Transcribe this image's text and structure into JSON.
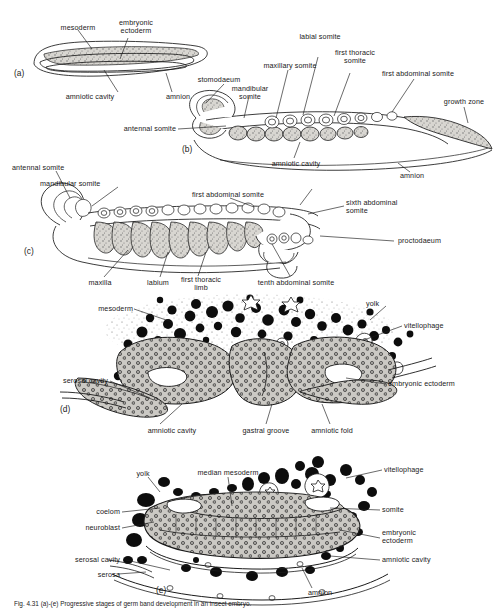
{
  "figure": {
    "panels": [
      {
        "id": "a",
        "id_label": "(a)",
        "labels": [
          {
            "name": "mesoderm",
            "text": "mesoderm"
          },
          {
            "name": "embryonic-ectoderm",
            "text": "embryonic\nectoderm"
          },
          {
            "name": "amniotic-cavity",
            "text": "amniotic cavity"
          },
          {
            "name": "amnion",
            "text": "amnion"
          }
        ]
      },
      {
        "id": "b",
        "id_label": "(b)",
        "labels": [
          {
            "name": "stomodaeum",
            "text": "stomodaeum"
          },
          {
            "name": "mandibular-somite",
            "text": "mandibular\nsomite"
          },
          {
            "name": "maxillary-somite",
            "text": "maxillary somite"
          },
          {
            "name": "labial-somite",
            "text": "labial somite"
          },
          {
            "name": "first-thoracic-somite",
            "text": "first thoracic\nsomite"
          },
          {
            "name": "first-abdominal-somite",
            "text": "first abdominal somite"
          },
          {
            "name": "growth-zone",
            "text": "growth zone"
          },
          {
            "name": "antennal-somite",
            "text": "antennal somite"
          },
          {
            "name": "amniotic-cavity",
            "text": "amniotic cavity"
          },
          {
            "name": "amnion",
            "text": "amnion"
          }
        ]
      },
      {
        "id": "c",
        "id_label": "(c)",
        "labels": [
          {
            "name": "antennal-somite",
            "text": "antennal somite"
          },
          {
            "name": "mandibular-somite",
            "text": "mandibular somite"
          },
          {
            "name": "first-abdominal-somite",
            "text": "first abdominal somite"
          },
          {
            "name": "sixth-abdominal-somite",
            "text": "sixth abdominal\nsomite"
          },
          {
            "name": "proctodaeum",
            "text": "proctodaeum"
          },
          {
            "name": "maxilla",
            "text": "maxilla"
          },
          {
            "name": "labium",
            "text": "labium"
          },
          {
            "name": "first-thoracic-limb",
            "text": "first thoracic\nlimb"
          },
          {
            "name": "tenth-abdominal-somite",
            "text": "tenth abdominal somite"
          }
        ]
      },
      {
        "id": "d",
        "id_label": "(d)",
        "labels": [
          {
            "name": "mesoderm",
            "text": "mesoderm"
          },
          {
            "name": "yolk",
            "text": "yolk"
          },
          {
            "name": "vitellophage",
            "text": "vitellophage"
          },
          {
            "name": "serosal-cavity",
            "text": "serosal cavity"
          },
          {
            "name": "embryonic-ectoderm",
            "text": "embryonic ectoderm"
          },
          {
            "name": "amniotic-cavity",
            "text": "amniotic cavity"
          },
          {
            "name": "gastral-groove",
            "text": "gastral groove"
          },
          {
            "name": "amniotic-fold",
            "text": "amniotic fold"
          }
        ]
      },
      {
        "id": "e",
        "id_label": "(e)",
        "labels": [
          {
            "name": "yolk",
            "text": "yolk"
          },
          {
            "name": "median-mesoderm",
            "text": "median mesoderm"
          },
          {
            "name": "vitellophage",
            "text": "vitellophage"
          },
          {
            "name": "coelom",
            "text": "coelom"
          },
          {
            "name": "somite",
            "text": "somite"
          },
          {
            "name": "neuroblast",
            "text": "neuroblast"
          },
          {
            "name": "embryonic-ectoderm",
            "text": "embryonic\nectoderm"
          },
          {
            "name": "serosal-cavity",
            "text": "serosal cavity"
          },
          {
            "name": "amniotic-cavity",
            "text": "amniotic cavity"
          },
          {
            "name": "serosa",
            "text": "serosa"
          },
          {
            "name": "amnion",
            "text": "amnion"
          }
        ]
      }
    ],
    "caption": "Fig. 4.31 (a)-(e) Progressive stages of germ band development in an insect embryo.",
    "colors": {
      "ink": "#1a1a1a",
      "tissue_fill": "#cfcdc8",
      "yolk_fill": "#0d0d0d",
      "paper": "#ffffff"
    }
  }
}
